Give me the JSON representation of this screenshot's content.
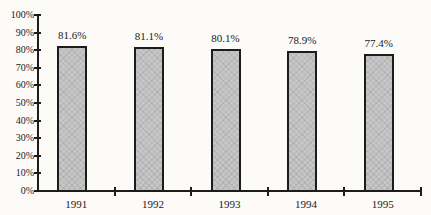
{
  "chart_data": {
    "type": "bar",
    "title": "",
    "xlabel": "",
    "ylabel": "",
    "categories": [
      "1991",
      "1992",
      "1993",
      "1994",
      "1995"
    ],
    "values": [
      81.6,
      81.1,
      80.1,
      78.9,
      77.4
    ],
    "value_labels": [
      "81.6%",
      "81.1%",
      "80.1%",
      "78.9%",
      "77.4%"
    ],
    "ylim": [
      0,
      100
    ],
    "y_tick_step": 10,
    "y_tick_labels": [
      "0%",
      "10%",
      "20%",
      "30%",
      "40%",
      "50%",
      "60%",
      "70%",
      "80%",
      "90%",
      "100%"
    ],
    "grid": false,
    "legend": false,
    "colors": {
      "bar_fill": "#c6c6c6",
      "bar_border": "#1c1c1c",
      "axis": "#1c1c1c",
      "text": "#1a1a1a",
      "background": "#fcfbf8"
    }
  }
}
